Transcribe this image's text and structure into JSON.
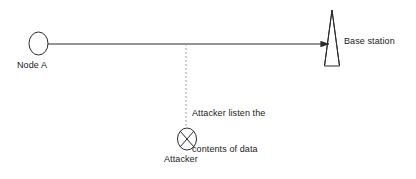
{
  "diagram": {
    "background_color": "#ffffff",
    "stroke_color": "#2b2b2b",
    "text_color": "#1a1a1a",
    "nodes": [
      {
        "id": "node-a",
        "label": "Node A",
        "shape": "ellipse",
        "cx": 38.5,
        "cy": 43.5,
        "rx": 9.5,
        "ry": 11.5
      },
      {
        "id": "base-station",
        "label": "Base station",
        "shape": "antenna-tower",
        "apex_x": 332,
        "apex_y": 10,
        "base_y": 66,
        "base_left_x": 325,
        "base_right_x": 340
      },
      {
        "id": "attacker",
        "label": "Attacker",
        "shape": "circle-with-x",
        "cx": 187,
        "cy": 139,
        "rx": 9.5,
        "ry": 11
      }
    ],
    "links": [
      {
        "id": "data-link",
        "from": "node-a",
        "to": "base-station",
        "style": "solid",
        "arrow": "end",
        "x1": 48,
        "y1": 44,
        "x2": 330,
        "y2": 44
      },
      {
        "id": "eavesdrop-link",
        "from": "attacker",
        "to": "data-link",
        "style": "dashed",
        "arrow": "none",
        "x1": 186,
        "y1": 44,
        "x2": 186,
        "y2": 128
      }
    ],
    "annotations": [
      {
        "id": "attacker-note",
        "line1": "Attacker listen the",
        "line2": "contents of data"
      }
    ]
  }
}
